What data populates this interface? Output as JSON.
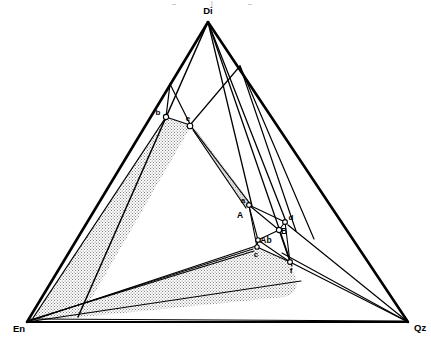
{
  "figure": {
    "width": 431,
    "height": 341,
    "background_color": "#ffffff",
    "line_color": "#000000",
    "stipple_color": "#6b6b6b"
  },
  "vertices": [
    {
      "id": "Di",
      "label": "Di",
      "x": 208,
      "y": 22,
      "label_x": 208,
      "label_y": 13,
      "anchor": "middle"
    },
    {
      "id": "En",
      "label": "En",
      "x": 27,
      "y": 322,
      "label_x": 14,
      "label_y": 331,
      "anchor": "middle"
    },
    {
      "id": "Qz",
      "label": "Qz",
      "x": 408,
      "y": 322,
      "label_x": 420,
      "label_y": 330,
      "anchor": "middle"
    }
  ],
  "points": [
    {
      "id": "b",
      "label": "b",
      "x": 166,
      "y": 117,
      "label_x": 158,
      "label_y": 114,
      "marker": "circle"
    },
    {
      "id": "e",
      "label": "e",
      "x": 190,
      "y": 125,
      "label_x": 187,
      "label_y": 120,
      "marker": "circle"
    },
    {
      "id": "a",
      "label": "a",
      "x": 248,
      "y": 204,
      "label_x": 243,
      "label_y": 203,
      "marker": "circle"
    },
    {
      "id": "A",
      "label": "A",
      "x": 243,
      "y": 215,
      "label_x": 240,
      "label_y": 217,
      "marker": "none"
    },
    {
      "id": "d",
      "label": "d",
      "x": 284,
      "y": 221,
      "label_x": 290,
      "label_y": 219,
      "marker": "circle"
    },
    {
      "id": "B",
      "label": "B",
      "x": 279,
      "y": 230,
      "label_x": 283,
      "label_y": 231,
      "marker": "circle"
    },
    {
      "id": "Ab",
      "label": "Ab",
      "x": 258,
      "y": 240,
      "label_x": 263,
      "label_y": 242,
      "marker": "circle"
    },
    {
      "id": "c",
      "label": "c",
      "x": 257,
      "y": 247,
      "label_x": 256,
      "label_y": 256,
      "marker": "circle"
    },
    {
      "id": "f",
      "label": "f",
      "x": 290,
      "y": 262,
      "label_x": 291,
      "label_y": 272,
      "marker": "circle"
    }
  ],
  "crop_marks": [
    {
      "label": "–",
      "x": 174,
      "y": 5
    },
    {
      "label": "|",
      "x": 212,
      "y": 5
    },
    {
      "label": "–",
      "x": 250,
      "y": 5
    }
  ],
  "regions": [
    {
      "id": "upper-stipple",
      "name": "upper-stippled-field",
      "description": "large stippled band from b/e down the left side toward En",
      "path": "M 166,117 L 190,125 L 80,315 L 33,317 Z"
    },
    {
      "id": "narrow-stipple",
      "name": "narrow-stippled-band",
      "description": "narrow stippled wedge from e down to a",
      "path": "M 190,125 L 196,130 L 252,205 L 246,206 Z"
    },
    {
      "id": "lower-stipple",
      "name": "lower-stippled-field",
      "description": "lower stippled field bounded by En, c, f and a rounded right corner",
      "path": "M 27,322 L 255,246 L 288,262 L 295,278 Q 298,292 286,297 L 80,318 Z"
    }
  ],
  "edges": [
    {
      "id": "Di-En",
      "name": "edge-di-en",
      "from": [
        208,
        22
      ],
      "to": [
        27,
        322
      ],
      "width": 2.3
    },
    {
      "id": "Di-Qz",
      "name": "edge-di-qz",
      "from": [
        208,
        22
      ],
      "to": [
        408,
        322
      ],
      "width": 2.3
    },
    {
      "id": "En-Qz",
      "name": "edge-en-qz",
      "from": [
        27,
        322
      ],
      "to": [
        408,
        322
      ],
      "width": 2.0
    }
  ],
  "internal_lines": [
    {
      "name": "line-di-to-lowerleft",
      "d": "M 208,22 L 78,317",
      "width": 1.4
    },
    {
      "name": "line-di-through-a",
      "d": "M 208,22 L 252,206",
      "width": 1.3
    },
    {
      "name": "line-di-to-d",
      "d": "M 208,22 L 287,224",
      "width": 1.3
    },
    {
      "name": "line-di-to-f",
      "d": "M 208,22 L 292,266",
      "width": 1.3
    },
    {
      "name": "line-b-to-e",
      "d": "M 166,117 L 190,125",
      "width": 1.2
    },
    {
      "name": "line-b-to-basal",
      "d": "M 166,117 L 33,318",
      "width": 1.2
    },
    {
      "name": "line-ridge-left",
      "d": "M 170,84 L 166,117",
      "width": 1.2
    },
    {
      "name": "line-ridge-to-e",
      "d": "M 170,84 L 190,125",
      "width": 1.2
    },
    {
      "name": "line-e-to-crest",
      "d": "M 190,125 L 240,66",
      "width": 1.2
    },
    {
      "name": "line-crest-right",
      "d": "M 240,66 L 314,239",
      "width": 1.2
    },
    {
      "name": "line-e-to-a",
      "d": "M 190,125 L 250,205",
      "width": 1.2
    },
    {
      "name": "line-e-down",
      "d": "M 190,125 L 246,207",
      "width": 1.2
    },
    {
      "name": "line-a-to-d",
      "d": "M 249,205 L 285,222",
      "width": 1.1
    },
    {
      "name": "line-a-to-c",
      "d": "M 249,205 L 257,247",
      "width": 1.1
    },
    {
      "name": "line-a-to-ab",
      "d": "M 249,205 L 258,240",
      "width": 1.1
    },
    {
      "name": "line-d-to-b2",
      "d": "M 285,222 L 279,230",
      "width": 1.1
    },
    {
      "name": "line-d-to-f",
      "d": "M 285,222 L 290,262",
      "width": 1.1
    },
    {
      "name": "line-b2-to-ab",
      "d": "M 279,230 L 258,240",
      "width": 1.1
    },
    {
      "name": "line-b2-to-f",
      "d": "M 279,230 L 290,262",
      "width": 1.1
    },
    {
      "name": "line-ab-to-c",
      "d": "M 258,240 L 257,247",
      "width": 1.1
    },
    {
      "name": "line-ab-to-f",
      "d": "M 258,240 L 290,262",
      "width": 1.1
    },
    {
      "name": "line-c-to-f",
      "d": "M 257,247 L 290,262",
      "width": 1.1
    },
    {
      "name": "line-c-to-en",
      "d": "M 257,247 L 27,322",
      "width": 1.2
    },
    {
      "name": "line-c-to-en-2",
      "d": "M 255,250 L 30,320",
      "width": 1.1
    },
    {
      "name": "line-f-to-qz",
      "d": "M 290,262 L 408,322",
      "width": 1.2
    },
    {
      "name": "line-join-to-qz",
      "d": "M 281,252 L 408,322",
      "width": 1.1
    },
    {
      "name": "line-en-to-qzish",
      "d": "M 27,322 L 300,280",
      "width": 1.1
    },
    {
      "name": "line-basal-inner",
      "d": "M 30,320 L 408,322",
      "width": 1.0
    },
    {
      "name": "line-en-fan-1",
      "d": "M 27,322 L 253,249",
      "width": 1.0
    },
    {
      "name": "line-qz-up-left",
      "d": "M 408,322 L 287,225",
      "width": 1.1
    }
  ]
}
